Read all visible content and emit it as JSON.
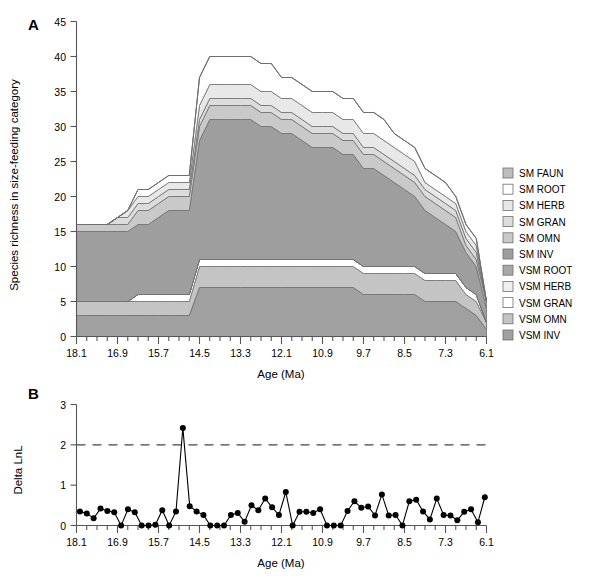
{
  "figure": {
    "panel_a_letter": "A",
    "panel_b_letter": "B",
    "x_axis_title": "Age (Ma)",
    "panel_a_y_title": "Species richness in size-feeding category",
    "panel_b_y_title": "Delta LnL"
  },
  "legend": {
    "items": [
      {
        "label": "SM FAUN",
        "color": "#bdbdbd"
      },
      {
        "label": "SM ROOT",
        "color": "#ffffff"
      },
      {
        "label": "SM HERB",
        "color": "#e8e8e8"
      },
      {
        "label": "SM GRAN",
        "color": "#dcdcdc"
      },
      {
        "label": "SM OMN",
        "color": "#c9c9c9"
      },
      {
        "label": "SM INV",
        "color": "#9e9e9e"
      },
      {
        "label": "VSM ROOT",
        "color": "#a8a8a8"
      },
      {
        "label": "VSM HERB",
        "color": "#f0f0f0"
      },
      {
        "label": "VSM GRAN",
        "color": "#ffffff"
      },
      {
        "label": "VSM OMN",
        "color": "#c4c4c4"
      },
      {
        "label": "VSM INV",
        "color": "#a0a0a0"
      }
    ]
  },
  "chart_data": [
    {
      "type": "area",
      "panel": "A",
      "title": "",
      "xlabel": "Age (Ma)",
      "ylabel": "Species richness in size-feeding category",
      "xlim": [
        18.1,
        6.1
      ],
      "ylim": [
        0,
        45
      ],
      "x_ticks": [
        18.1,
        16.9,
        15.7,
        14.5,
        13.3,
        12.1,
        10.9,
        9.7,
        8.5,
        7.3,
        6.1
      ],
      "y_ticks": [
        0,
        5,
        10,
        15,
        20,
        25,
        30,
        35,
        40,
        45
      ],
      "x_minor_step": 0.3,
      "grid": false,
      "legend_position": "right",
      "stacking": "bottom-to-top",
      "x": [
        18.1,
        17.8,
        17.5,
        17.2,
        16.9,
        16.6,
        16.3,
        16.0,
        15.7,
        15.4,
        15.1,
        14.8,
        14.5,
        14.2,
        13.9,
        13.6,
        13.3,
        13.0,
        12.7,
        12.4,
        12.1,
        11.8,
        11.5,
        11.2,
        10.9,
        10.6,
        10.3,
        10.0,
        9.7,
        9.4,
        9.1,
        8.8,
        8.5,
        8.2,
        7.9,
        7.6,
        7.3,
        7.0,
        6.7,
        6.4,
        6.1
      ],
      "series": [
        {
          "name": "VSM INV",
          "color": "#a0a0a0",
          "values": [
            3,
            3,
            3,
            3,
            3,
            3,
            3,
            3,
            3,
            3,
            3,
            3,
            7,
            7,
            7,
            7,
            7,
            7,
            7,
            7,
            7,
            7,
            7,
            7,
            7,
            7,
            7,
            7,
            6,
            6,
            6,
            6,
            6,
            6,
            5,
            5,
            5,
            5,
            4,
            3,
            1
          ]
        },
        {
          "name": "VSM OMN",
          "color": "#c4c4c4",
          "values": [
            2,
            2,
            2,
            2,
            2,
            2,
            2,
            2,
            2,
            2,
            2,
            2,
            3,
            3,
            3,
            3,
            3,
            3,
            3,
            3,
            3,
            3,
            3,
            3,
            3,
            3,
            3,
            3,
            3,
            3,
            3,
            3,
            3,
            3,
            3,
            3,
            3,
            3,
            2,
            2,
            1
          ]
        },
        {
          "name": "VSM GRAN",
          "color": "#ffffff",
          "values": [
            0,
            0,
            0,
            0,
            0,
            0,
            1,
            1,
            1,
            1,
            1,
            1,
            1,
            1,
            1,
            1,
            1,
            1,
            1,
            1,
            1,
            1,
            1,
            1,
            1,
            1,
            1,
            1,
            1,
            1,
            1,
            1,
            1,
            1,
            1,
            1,
            1,
            1,
            1,
            1,
            0
          ]
        },
        {
          "name": "VSM HERB",
          "color": "#f0f0f0",
          "values": [
            0,
            0,
            0,
            0,
            0,
            0,
            0,
            0,
            0,
            0,
            0,
            0,
            0,
            0,
            0,
            0,
            0,
            0,
            0,
            0,
            0,
            0,
            0,
            0,
            0,
            0,
            0,
            0,
            0,
            0,
            0,
            0,
            0,
            0,
            0,
            0,
            0,
            0,
            0,
            0,
            0
          ]
        },
        {
          "name": "VSM ROOT",
          "color": "#a8a8a8",
          "values": [
            0,
            0,
            0,
            0,
            0,
            0,
            0,
            0,
            0,
            0,
            0,
            0,
            0,
            0,
            0,
            0,
            0,
            0,
            0,
            0,
            0,
            0,
            0,
            0,
            0,
            0,
            0,
            0,
            0,
            0,
            0,
            0,
            0,
            0,
            0,
            0,
            0,
            0,
            0,
            0,
            0
          ]
        },
        {
          "name": "SM INV",
          "color": "#9e9e9e",
          "values": [
            10,
            10,
            10,
            10,
            10,
            10,
            10,
            10,
            11,
            12,
            12,
            12,
            17,
            20,
            20,
            20,
            20,
            20,
            19,
            19,
            18,
            18,
            17,
            16,
            16,
            16,
            15,
            15,
            14,
            14,
            13,
            12,
            11,
            10,
            9,
            8,
            7,
            6,
            5,
            4,
            2
          ]
        },
        {
          "name": "SM OMN",
          "color": "#c9c9c9",
          "values": [
            1,
            1,
            1,
            1,
            1,
            1,
            2,
            2,
            2,
            2,
            2,
            2,
            2,
            2,
            2,
            2,
            2,
            2,
            2,
            2,
            2,
            2,
            2,
            2,
            2,
            2,
            2,
            2,
            2,
            2,
            2,
            2,
            2,
            2,
            2,
            2,
            2,
            2,
            1,
            1,
            1
          ]
        },
        {
          "name": "SM GRAN",
          "color": "#dcdcdc",
          "values": [
            0,
            0,
            0,
            0,
            1,
            1,
            1,
            1,
            1,
            1,
            1,
            1,
            1,
            1,
            1,
            1,
            1,
            1,
            1,
            1,
            1,
            1,
            1,
            1,
            1,
            1,
            1,
            1,
            1,
            1,
            1,
            1,
            1,
            1,
            1,
            1,
            1,
            1,
            1,
            1,
            0
          ]
        },
        {
          "name": "SM HERB",
          "color": "#e8e8e8",
          "values": [
            0,
            0,
            0,
            0,
            0,
            1,
            1,
            1,
            1,
            1,
            1,
            1,
            2,
            2,
            2,
            2,
            2,
            2,
            2,
            2,
            2,
            2,
            2,
            2,
            2,
            2,
            2,
            2,
            2,
            2,
            2,
            2,
            2,
            2,
            1,
            1,
            1,
            1,
            1,
            1,
            0
          ]
        },
        {
          "name": "SM ROOT",
          "color": "#ffffff",
          "values": [
            0,
            0,
            0,
            0,
            0,
            0,
            1,
            1,
            1,
            1,
            1,
            1,
            4,
            4,
            4,
            4,
            4,
            4,
            4,
            4,
            3,
            3,
            3,
            3,
            3,
            3,
            3,
            3,
            3,
            3,
            3,
            2,
            2,
            2,
            2,
            2,
            2,
            1,
            1,
            1,
            0
          ]
        },
        {
          "name": "SM FAUN",
          "color": "#bdbdbd",
          "values": [
            0,
            0,
            0,
            0,
            0,
            0,
            0,
            0,
            0,
            0,
            0,
            0,
            0,
            0,
            0,
            0,
            0,
            0,
            0,
            0,
            0,
            0,
            0,
            0,
            0,
            0,
            0,
            0,
            0,
            0,
            0,
            0,
            0,
            0,
            0,
            0,
            0,
            0,
            0,
            0,
            0
          ]
        }
      ],
      "totals": [
        16,
        15,
        16,
        15,
        18,
        19,
        21,
        22,
        24,
        26,
        25,
        24,
        34,
        37,
        37,
        37,
        37,
        37,
        36,
        35,
        34,
        34,
        33,
        32,
        32,
        32,
        30,
        30,
        29,
        28,
        27,
        26,
        25,
        23,
        21,
        19,
        17,
        15,
        13,
        11,
        4
      ]
    },
    {
      "type": "line",
      "panel": "B",
      "title": "",
      "xlabel": "Age (Ma)",
      "ylabel": "Delta LnL",
      "xlim": [
        18.1,
        6.1
      ],
      "ylim": [
        0,
        3
      ],
      "x_ticks": [
        18.1,
        16.9,
        15.7,
        14.5,
        13.3,
        12.1,
        10.9,
        9.7,
        8.5,
        7.3,
        6.1
      ],
      "y_ticks": [
        0,
        1,
        2,
        3
      ],
      "grid": false,
      "threshold_line": {
        "value": 2,
        "style": "dashed",
        "label": ""
      },
      "marker": "filled-circle",
      "x": [
        18.0,
        17.7,
        17.4,
        17.1,
        16.8,
        16.5,
        16.2,
        15.9,
        15.6,
        15.3,
        15.0,
        14.7,
        14.4,
        14.1,
        13.8,
        13.5,
        13.2,
        12.9,
        12.6,
        12.3,
        12.0,
        11.7,
        11.4,
        11.1,
        10.8,
        10.5,
        10.2,
        9.9,
        9.6,
        9.3,
        9.0,
        8.7,
        8.4,
        8.1,
        7.8,
        7.5,
        7.2,
        6.9,
        6.6,
        6.3,
        6.15
      ],
      "y": [
        0.35,
        0.3,
        0.18,
        0.42,
        0.36,
        0.33,
        0.0,
        0.4,
        0.33,
        0.0,
        0.0,
        0.02,
        0.38,
        0.0,
        0.35,
        2.42,
        0.48,
        0.35,
        0.26,
        0.0,
        0.0,
        0.0,
        0.26,
        0.31,
        0.09,
        0.5,
        0.38,
        0.67,
        0.45,
        0.26,
        0.83,
        0.0,
        0.34,
        0.34,
        0.31,
        0.4,
        0.0,
        0.0,
        0.0,
        0.36,
        0.6,
        0.44,
        0.47,
        0.25,
        0.77,
        0.25,
        0.26,
        0.0,
        0.6,
        0.64,
        0.35,
        0.15,
        0.67,
        0.26,
        0.25,
        0.13,
        0.34,
        0.4,
        0.08,
        0.7
      ]
    }
  ]
}
